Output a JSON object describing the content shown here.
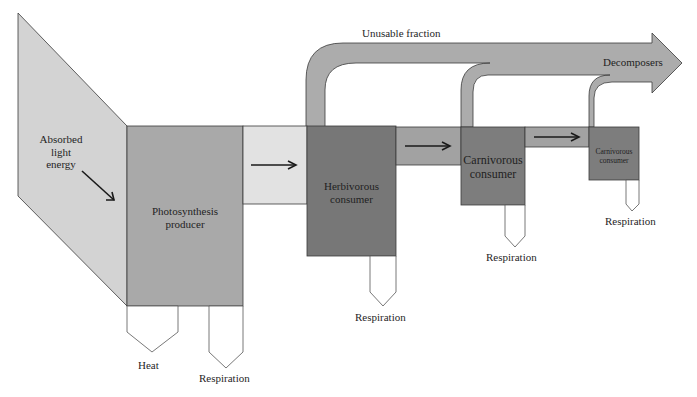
{
  "diagram": {
    "type": "energy-flow",
    "colors": {
      "incoming_light": "#d3d3d3",
      "producer": "#a9a9a9",
      "light_band": "#e2e2e2",
      "herbivore": "#777777",
      "carnivore": "#7d7d7d",
      "band_mid": "#a2a2a2",
      "unusable_band": "#acacac",
      "outline": "#3a3a3a",
      "spout": "#ffffff"
    },
    "labels": {
      "absorbed_light": [
        "Absorbed",
        "light",
        "energy"
      ],
      "producer": [
        "Photosynthesis",
        "producer"
      ],
      "herbivore": [
        "Herbivorous",
        "consumer"
      ],
      "carnivore1": [
        "Carnivorous",
        "consumer"
      ],
      "carnivore2": [
        "Carnivorous",
        "consumer"
      ],
      "unusable_fraction": "Unusable fraction",
      "decomposers": "Decomposers",
      "heat": "Heat",
      "respiration_producer": "Respiration",
      "respiration_herbivore": "Respiration",
      "respiration_carnivore1": "Respiration",
      "respiration_carnivore2": "Respiration"
    },
    "nodes": [
      {
        "id": "absorbed_light",
        "label": "Absorbed light energy"
      },
      {
        "id": "producer",
        "label": "Photosynthesis producer"
      },
      {
        "id": "herbivore",
        "label": "Herbivorous consumer"
      },
      {
        "id": "carnivore1",
        "label": "Carnivorous consumer"
      },
      {
        "id": "carnivore2",
        "label": "Carnivorous consumer"
      },
      {
        "id": "decomposers",
        "label": "Decomposers"
      }
    ],
    "flows": [
      {
        "from": "absorbed_light",
        "to": "producer"
      },
      {
        "from": "producer",
        "to": "herbivore"
      },
      {
        "from": "herbivore",
        "to": "carnivore1"
      },
      {
        "from": "carnivore1",
        "to": "carnivore2"
      },
      {
        "from": "herbivore",
        "to": "decomposers",
        "label": "Unusable fraction"
      },
      {
        "from": "carnivore1",
        "to": "decomposers"
      },
      {
        "from": "carnivore2",
        "to": "decomposers"
      },
      {
        "from": "producer",
        "to": "heat",
        "label": "Heat"
      },
      {
        "from": "producer",
        "to": "respiration",
        "label": "Respiration"
      },
      {
        "from": "herbivore",
        "to": "respiration",
        "label": "Respiration"
      },
      {
        "from": "carnivore1",
        "to": "respiration",
        "label": "Respiration"
      },
      {
        "from": "carnivore2",
        "to": "respiration",
        "label": "Respiration"
      }
    ]
  }
}
